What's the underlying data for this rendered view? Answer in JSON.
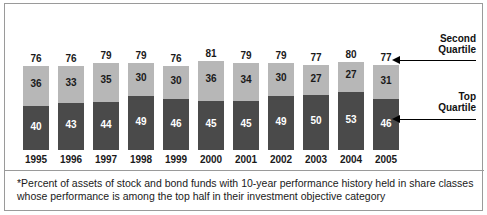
{
  "chart_data": {
    "type": "bar",
    "subtype": "stacked-vertical",
    "title": "",
    "subtitle": "",
    "xlabel": "",
    "ylabel": "",
    "ylim": [
      0,
      100
    ],
    "grid": false,
    "legend_position": "right",
    "categories": [
      "1995",
      "1996",
      "1997",
      "1998",
      "1999",
      "2000",
      "2001",
      "2002",
      "2003",
      "2004",
      "2005"
    ],
    "series": [
      {
        "name": "Top Quartile",
        "color": "#4a4a4a",
        "values": [
          40,
          43,
          44,
          49,
          46,
          45,
          45,
          49,
          50,
          53,
          46
        ]
      },
      {
        "name": "Second Quartile",
        "color": "#b7b7b7",
        "values": [
          36,
          33,
          35,
          30,
          30,
          36,
          34,
          30,
          27,
          27,
          31
        ]
      }
    ],
    "totals": [
      76,
      76,
      79,
      79,
      76,
      81,
      79,
      79,
      77,
      80,
      77
    ],
    "annotations": [
      "*Percent of assets of stock and bond funds with 10-year performance history held in share classes whose performance is among the top half in their investment objective category"
    ]
  },
  "legend": {
    "second_quartile_line1": "Second",
    "second_quartile_line2": "Quartile",
    "top_quartile_line1": "Top",
    "top_quartile_line2": "Quartile"
  },
  "footnote": {
    "text": "*Percent of assets of stock and bond funds with 10-year performance history held in share classes whose performance is among the top half in their investment objective category"
  },
  "colors": {
    "second_quartile": "#b7b7b7",
    "top_quartile": "#4a4a4a",
    "frame_border": "#9a9a9a",
    "text": "#1a1a1a",
    "background": "#ffffff"
  }
}
